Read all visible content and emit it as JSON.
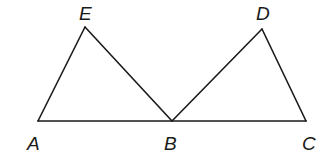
{
  "diagram": {
    "type": "geometry",
    "stroke_color": "#1a1a1a",
    "background": "#ffffff",
    "points": {
      "A": {
        "label": "A",
        "x": 38,
        "y": 121,
        "label_x": 27,
        "label_y": 150
      },
      "E": {
        "label": "E",
        "x": 85,
        "y": 27,
        "label_x": 79,
        "label_y": 20
      },
      "B": {
        "label": "B",
        "x": 172,
        "y": 121,
        "label_x": 164,
        "label_y": 150
      },
      "D": {
        "label": "D",
        "x": 262,
        "y": 29,
        "label_x": 256,
        "label_y": 20
      },
      "C": {
        "label": "C",
        "x": 306,
        "y": 121,
        "label_x": 302,
        "label_y": 150
      }
    },
    "segments": [
      [
        "A",
        "E"
      ],
      [
        "E",
        "B"
      ],
      [
        "A",
        "C"
      ],
      [
        "B",
        "D"
      ],
      [
        "D",
        "C"
      ]
    ]
  }
}
